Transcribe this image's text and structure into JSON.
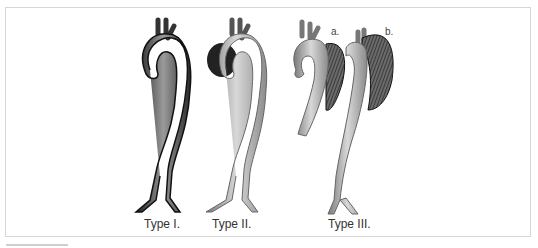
{
  "figure": {
    "types": [
      {
        "id": "type1",
        "label": "Type I."
      },
      {
        "id": "type2",
        "label": "Type II."
      },
      {
        "id": "type3",
        "label": "Type III.",
        "sublabels": [
          "a.",
          "b."
        ]
      }
    ]
  }
}
